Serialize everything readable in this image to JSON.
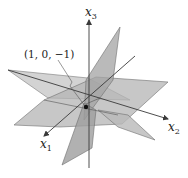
{
  "figure": {
    "type": "3d-planes-intersection",
    "axes": {
      "x1": {
        "var": "x",
        "sub": "1"
      },
      "x2": {
        "var": "x",
        "sub": "2"
      },
      "x3": {
        "var": "x",
        "sub": "3"
      }
    },
    "point": {
      "label": "(1, 0, −1)",
      "coords": [
        1,
        0,
        -1
      ]
    },
    "colors": {
      "plane_fill": "#b4b4b4",
      "plane_dark": "#8f8f8f",
      "plane_edge": "#6e6e6e",
      "axis": "#3a3a3a",
      "point": "#111111",
      "background": "#ffffff"
    }
  }
}
